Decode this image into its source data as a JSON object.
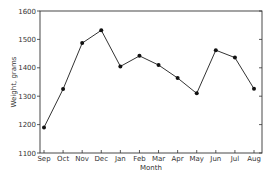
{
  "chart_data": {
    "type": "line",
    "title": "",
    "xlabel": "Month",
    "ylabel": "Weight, grams",
    "categories": [
      "Sep",
      "Oct",
      "Nov",
      "Dec",
      "Jan",
      "Feb",
      "Mar",
      "Apr",
      "May",
      "Jun",
      "Jul",
      "Aug"
    ],
    "series": [
      {
        "name": "Weight",
        "values": [
          1190,
          1325,
          1487,
          1532,
          1405,
          1442,
          1410,
          1364,
          1310,
          1462,
          1436,
          1326
        ],
        "marker": "circle",
        "color": "#111111"
      }
    ],
    "ylim": [
      1100,
      1600
    ],
    "yticks": [
      1100,
      1200,
      1300,
      1400,
      1500,
      1600
    ],
    "ytick_labels": [
      "1100",
      "1200",
      "1300",
      "1400",
      "1500",
      "1600"
    ],
    "grid": false,
    "legend": "none"
  }
}
